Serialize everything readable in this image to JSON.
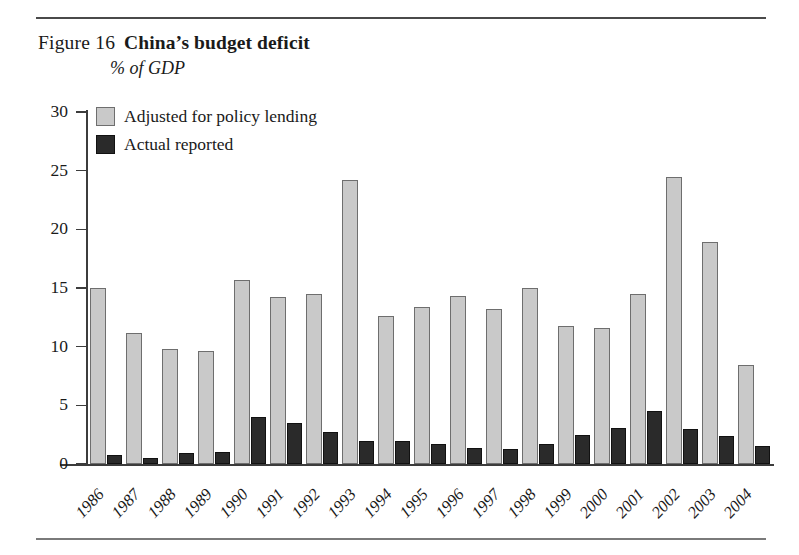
{
  "figure": {
    "label": "Figure 16",
    "title": "China’s budget deficit",
    "subtitle": "% of GDP"
  },
  "legend": {
    "position": "top-left-inside",
    "entries": [
      {
        "label": "Adjusted for policy lending",
        "color": "#c9c9c9",
        "swatch": "light-gray-square"
      },
      {
        "label": "Actual reported",
        "color": "#2a2a2a",
        "swatch": "dark-square"
      }
    ]
  },
  "chart_data": {
    "type": "bar",
    "title": "China’s budget deficit",
    "subtitle": "% of GDP",
    "xlabel": "",
    "ylabel": "",
    "ylim": [
      0,
      30
    ],
    "yticks": [
      0,
      5,
      10,
      15,
      20,
      25,
      30
    ],
    "ytick_labels": [
      "0",
      "5",
      "10",
      "15",
      "20",
      "25",
      "30"
    ],
    "grid": false,
    "legend_position": "upper left",
    "categories": [
      "1986",
      "1987",
      "1988",
      "1989",
      "1990",
      "1991",
      "1992",
      "1993",
      "1994",
      "1995",
      "1996",
      "1997",
      "1998",
      "1999",
      "2000",
      "2001",
      "2002",
      "2003",
      "2004"
    ],
    "series": [
      {
        "name": "Adjusted for policy lending",
        "color": "#c9c9c9",
        "values": [
          15.0,
          11.2,
          9.8,
          9.6,
          15.7,
          14.2,
          14.5,
          24.2,
          12.6,
          13.4,
          14.3,
          13.2,
          15.0,
          11.8,
          11.6,
          14.5,
          24.5,
          18.9,
          8.4
        ]
      },
      {
        "name": "Actual reported",
        "color": "#2a2a2a",
        "values": [
          0.8,
          0.5,
          0.9,
          1.0,
          4.0,
          3.5,
          2.7,
          2.0,
          2.0,
          1.7,
          1.4,
          1.3,
          1.7,
          2.5,
          3.1,
          4.5,
          3.0,
          2.4,
          1.5
        ]
      }
    ]
  }
}
